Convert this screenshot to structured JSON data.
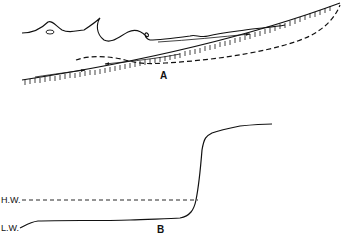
{
  "panels": [
    {
      "id": "A",
      "label": "A",
      "description": "Breaking waves running up a sloping beach; swash up-rush and backwash with dashed return-flow/profile line"
    },
    {
      "id": "B",
      "label": "B",
      "description": "Beach profile with steep scarp rising above high water"
    }
  ],
  "labels": {
    "panel_a": "A",
    "panel_b": "B",
    "high_water": "H.W.",
    "low_water": "L.W."
  },
  "colors": {
    "ink": "#111111",
    "background": "#ffffff"
  }
}
